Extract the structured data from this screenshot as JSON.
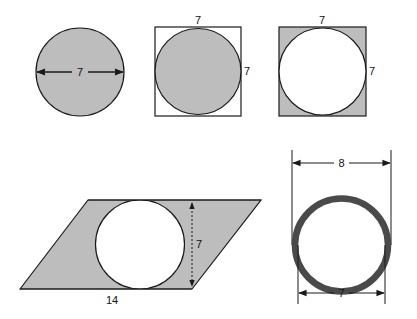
{
  "colors": {
    "shade": "#bdbdbd",
    "ring": "#4a4a4a",
    "stroke": "#1a1a1a",
    "background": "#ffffff"
  },
  "figures": {
    "circle": {
      "diameter_label": "7"
    },
    "square_shaded_circle": {
      "top_label": "7",
      "side_label": "7"
    },
    "square_shaded_corners": {
      "top_label": "7",
      "side_label": "7"
    },
    "parallelogram": {
      "base_label": "14",
      "height_label": "7"
    },
    "ring": {
      "outer_label": "8",
      "inner_label": "7"
    }
  }
}
